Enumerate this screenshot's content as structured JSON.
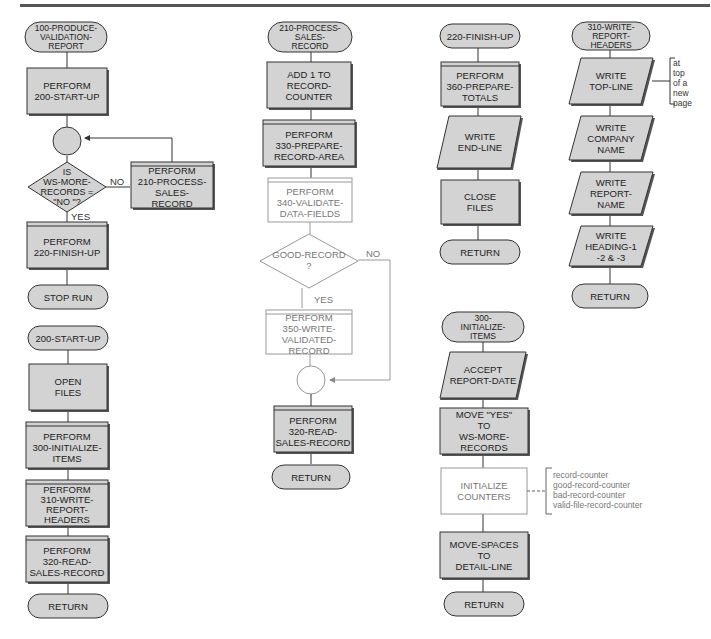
{
  "colors": {
    "fill": "#d3d3d3",
    "fill_light": "#ffffff",
    "stroke": "#333333",
    "stroke_light": "#999999",
    "shadow": "#555555"
  },
  "diagram": {
    "type": "program-flowchart",
    "modules": [
      {
        "id": "100",
        "title": "100-PRODUCE-\nVALIDATION-\nREPORT",
        "steps": [
          "PERFORM\n200-START-UP",
          "PERFORM\n210-PROCESS-\nSALES-\nRECORD",
          "IS\nWS-MORE-\nRECORDS =\n\"NO \"?",
          "PERFORM\n220-FINISH-UP",
          "STOP RUN"
        ],
        "branch_yes": "YES",
        "branch_no": "NO"
      },
      {
        "id": "200",
        "title": "200-START-UP",
        "steps": [
          "OPEN\nFILES",
          "PERFORM\n300-INITIALIZE-\nITEMS",
          "PERFORM\n310-WRITE-\nREPORT-\nHEADERS",
          "PERFORM\n320-READ-\nSALES-RECORD",
          "RETURN"
        ]
      },
      {
        "id": "210",
        "title": "210-PROCESS-\nSALES-\nRECORD",
        "steps": [
          "ADD 1 TO\nRECORD-COUNTER",
          "PERFORM\n330-PREPARE-\nRECORD-AREA",
          "PERFORM\n340-VALIDATE-\nDATA-FIELDS",
          "GOOD-RECORD\n?",
          "PERFORM\n350-WRITE-\nVALIDATED-RECORD",
          "PERFORM\n320-READ-\nSALES-RECORD",
          "RETURN"
        ],
        "branch_yes": "YES",
        "branch_no": "NO"
      },
      {
        "id": "220",
        "title": "220-FINISH-UP",
        "steps": [
          "PERFORM\n360-PREPARE-\nTOTALS",
          "WRITE\nEND-LINE",
          "CLOSE\nFILES",
          "RETURN"
        ]
      },
      {
        "id": "300",
        "title": "300-\nINITIALIZE-\nITEMS",
        "steps": [
          "ACCEPT\nREPORT-DATE",
          "MOVE \"YES\"\nTO\nWS-MORE-RECORDS",
          "INITIALIZE\nCOUNTERS",
          "MOVE-SPACES\nTO\nDETAIL-LINE",
          "RETURN"
        ],
        "annotation": "record-counter\ngood-record-counter\nbad-record-counter\nvalid-file-record-counter"
      },
      {
        "id": "310",
        "title": "310-WRITE-\nREPORT-HEADERS",
        "steps": [
          "WRITE\nTOP-LINE",
          "WRITE\nCOMPANY\nNAME",
          "WRITE\nREPORT-\nNAME",
          "WRITE\nHEADING-1\n-2 & -3",
          "RETURN"
        ],
        "annotation": "at\ntop\nof a\nnew\npage"
      }
    ]
  }
}
